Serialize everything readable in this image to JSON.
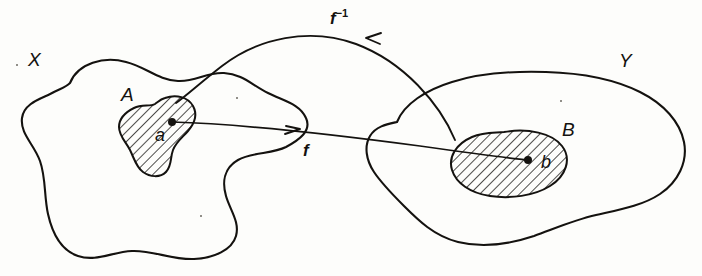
{
  "figure": {
    "background_color": "#fdfdfb",
    "ink_color": "#14120f",
    "style": "hand-drawn line diagram"
  },
  "sets": {
    "domain": {
      "label": "X",
      "name": "domain-set",
      "description": "large irregular blob on the left"
    },
    "codomain": {
      "label": "Y",
      "name": "codomain-set",
      "description": "large irregular blob on the right"
    },
    "subset_a": {
      "label": "A",
      "name": "subset-A",
      "description": "hatched irregular region inside X",
      "fill": "diagonal-hatch"
    },
    "subset_b": {
      "label": "B",
      "name": "subset-B",
      "description": "hatched oval region inside Y",
      "fill": "diagonal-hatch"
    }
  },
  "points": {
    "a": {
      "label": "a",
      "name": "point-a",
      "x": 172,
      "y": 122,
      "inside": "A"
    },
    "b": {
      "label": "b",
      "name": "point-b",
      "x": 528,
      "y": 160,
      "inside": "B"
    }
  },
  "mappings": {
    "forward": {
      "label": "f",
      "superscript": "",
      "name": "forward-map",
      "direction": "left-to-right",
      "from": "a",
      "to": "b",
      "arrow": "right",
      "label_position": "below-line"
    },
    "inverse": {
      "label": "f",
      "superscript": "−1",
      "name": "inverse-map",
      "direction": "right-to-left",
      "from": "B",
      "to": "A",
      "arrow": "left",
      "label_position": "above-arc"
    }
  }
}
